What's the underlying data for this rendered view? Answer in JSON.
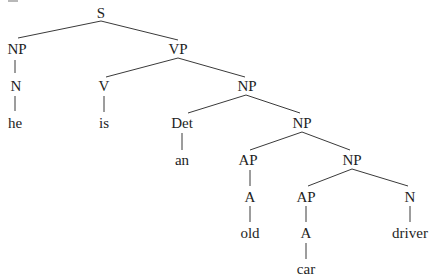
{
  "diagram": {
    "type": "syntax-tree",
    "sentence": "he is an old car driver",
    "colors": {
      "line": "#3a3a3a",
      "text": "#1e1e1e",
      "background": "#ffffff"
    },
    "nodes": [
      {
        "id": "s",
        "label": "S",
        "x": 101,
        "y": 18,
        "kind": "phrase"
      },
      {
        "id": "np1",
        "label": "NP",
        "x": 17,
        "y": 54,
        "kind": "phrase"
      },
      {
        "id": "vp",
        "label": "VP",
        "x": 178,
        "y": 54,
        "kind": "phrase"
      },
      {
        "id": "n1",
        "label": "N",
        "x": 16,
        "y": 91,
        "kind": "category"
      },
      {
        "id": "v",
        "label": "V",
        "x": 104,
        "y": 91,
        "kind": "category"
      },
      {
        "id": "np2",
        "label": "NP",
        "x": 247,
        "y": 91,
        "kind": "phrase"
      },
      {
        "id": "he",
        "label": "he",
        "x": 15,
        "y": 128,
        "kind": "word"
      },
      {
        "id": "is",
        "label": "is",
        "x": 104,
        "y": 128,
        "kind": "word"
      },
      {
        "id": "det",
        "label": "Det",
        "x": 182,
        "y": 128,
        "kind": "category"
      },
      {
        "id": "np3",
        "label": "NP",
        "x": 302,
        "y": 128,
        "kind": "phrase"
      },
      {
        "id": "an",
        "label": "an",
        "x": 182,
        "y": 165,
        "kind": "word"
      },
      {
        "id": "ap1",
        "label": "AP",
        "x": 248,
        "y": 165,
        "kind": "phrase"
      },
      {
        "id": "np4",
        "label": "NP",
        "x": 352,
        "y": 165,
        "kind": "phrase"
      },
      {
        "id": "a1",
        "label": "A",
        "x": 250,
        "y": 202,
        "kind": "category"
      },
      {
        "id": "ap2",
        "label": "AP",
        "x": 306,
        "y": 202,
        "kind": "phrase"
      },
      {
        "id": "n2",
        "label": "N",
        "x": 410,
        "y": 202,
        "kind": "category"
      },
      {
        "id": "old",
        "label": "old",
        "x": 250,
        "y": 238,
        "kind": "word"
      },
      {
        "id": "a2",
        "label": "A",
        "x": 306,
        "y": 238,
        "kind": "category"
      },
      {
        "id": "driver",
        "label": "driver",
        "x": 410,
        "y": 238,
        "kind": "word"
      },
      {
        "id": "car",
        "label": "car",
        "x": 306,
        "y": 274,
        "kind": "word"
      }
    ],
    "edges": [
      {
        "from": "s",
        "to": "np1",
        "x1": 101,
        "y1": 21,
        "x2": 18,
        "y2": 38
      },
      {
        "from": "s",
        "to": "vp",
        "x1": 101,
        "y1": 21,
        "x2": 178,
        "y2": 40
      },
      {
        "from": "np1",
        "to": "n1",
        "x1": 15,
        "y1": 60,
        "x2": 15,
        "y2": 73
      },
      {
        "from": "n1",
        "to": "he",
        "x1": 15,
        "y1": 96,
        "x2": 15,
        "y2": 111
      },
      {
        "from": "vp",
        "to": "v",
        "x1": 178,
        "y1": 58,
        "x2": 106,
        "y2": 77
      },
      {
        "from": "vp",
        "to": "np2",
        "x1": 178,
        "y1": 58,
        "x2": 245,
        "y2": 77
      },
      {
        "from": "v",
        "to": "is",
        "x1": 104,
        "y1": 96,
        "x2": 104,
        "y2": 112
      },
      {
        "from": "np2",
        "to": "det",
        "x1": 246,
        "y1": 95,
        "x2": 188,
        "y2": 113
      },
      {
        "from": "np2",
        "to": "np3",
        "x1": 246,
        "y1": 95,
        "x2": 300,
        "y2": 113
      },
      {
        "from": "det",
        "to": "an",
        "x1": 182,
        "y1": 133,
        "x2": 182,
        "y2": 150
      },
      {
        "from": "np3",
        "to": "ap1",
        "x1": 302,
        "y1": 132,
        "x2": 250,
        "y2": 150
      },
      {
        "from": "np3",
        "to": "np4",
        "x1": 302,
        "y1": 132,
        "x2": 350,
        "y2": 150
      },
      {
        "from": "ap1",
        "to": "a1",
        "x1": 250,
        "y1": 170,
        "x2": 250,
        "y2": 186
      },
      {
        "from": "np4",
        "to": "ap2",
        "x1": 352,
        "y1": 169,
        "x2": 308,
        "y2": 186
      },
      {
        "from": "np4",
        "to": "n2",
        "x1": 352,
        "y1": 169,
        "x2": 408,
        "y2": 186
      },
      {
        "from": "a1",
        "to": "old",
        "x1": 250,
        "y1": 206,
        "x2": 250,
        "y2": 222
      },
      {
        "from": "ap2",
        "to": "a2",
        "x1": 306,
        "y1": 206,
        "x2": 306,
        "y2": 222
      },
      {
        "from": "n2",
        "to": "driver",
        "x1": 410,
        "y1": 206,
        "x2": 410,
        "y2": 222
      },
      {
        "from": "a2",
        "to": "car",
        "x1": 306,
        "y1": 243,
        "x2": 306,
        "y2": 259
      }
    ]
  }
}
